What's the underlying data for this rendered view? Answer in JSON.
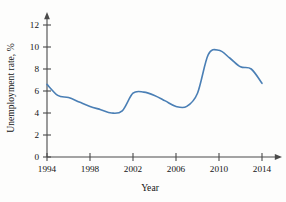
{
  "chart_data": {
    "type": "line",
    "title": "",
    "subtitle": "",
    "xlabel": "Year",
    "ylabel": "Unemployment rate, %",
    "xlim": [
      1994,
      2015
    ],
    "ylim": [
      0,
      13
    ],
    "xticks": [
      1994,
      1998,
      2002,
      2006,
      2010,
      2014
    ],
    "xtick_labels": [
      "1994",
      "1998",
      "2002",
      "2006",
      "2010",
      "2014"
    ],
    "yticks": [
      0,
      2,
      4,
      6,
      8,
      10,
      12
    ],
    "ytick_labels": [
      "0",
      "2",
      "4",
      "6",
      "8",
      "10",
      "12"
    ],
    "grid": false,
    "legend": false,
    "legend_position": "none",
    "line_color": "#4a7fb5",
    "axis_color": "#4a4a4a",
    "background_color": "#fdfdfc",
    "annotations": [],
    "series": [
      {
        "name": "Unemployment rate",
        "color": "#4a7fb5",
        "x": [
          1994,
          1995,
          1996,
          1997,
          1998,
          1999,
          2000,
          2001,
          2002,
          2003,
          2004,
          2005,
          2006,
          2007,
          2008,
          2009,
          2010,
          2011,
          2012,
          2013,
          2014
        ],
        "values": [
          6.6,
          5.6,
          5.4,
          5.0,
          4.6,
          4.3,
          4.0,
          4.2,
          5.8,
          5.9,
          5.6,
          5.1,
          4.6,
          4.6,
          5.8,
          9.3,
          9.7,
          9.0,
          8.2,
          8.0,
          6.7
        ]
      }
    ]
  },
  "figure": {
    "yaxis_label": "Unemployment rate, %",
    "xaxis_label": "Year"
  }
}
